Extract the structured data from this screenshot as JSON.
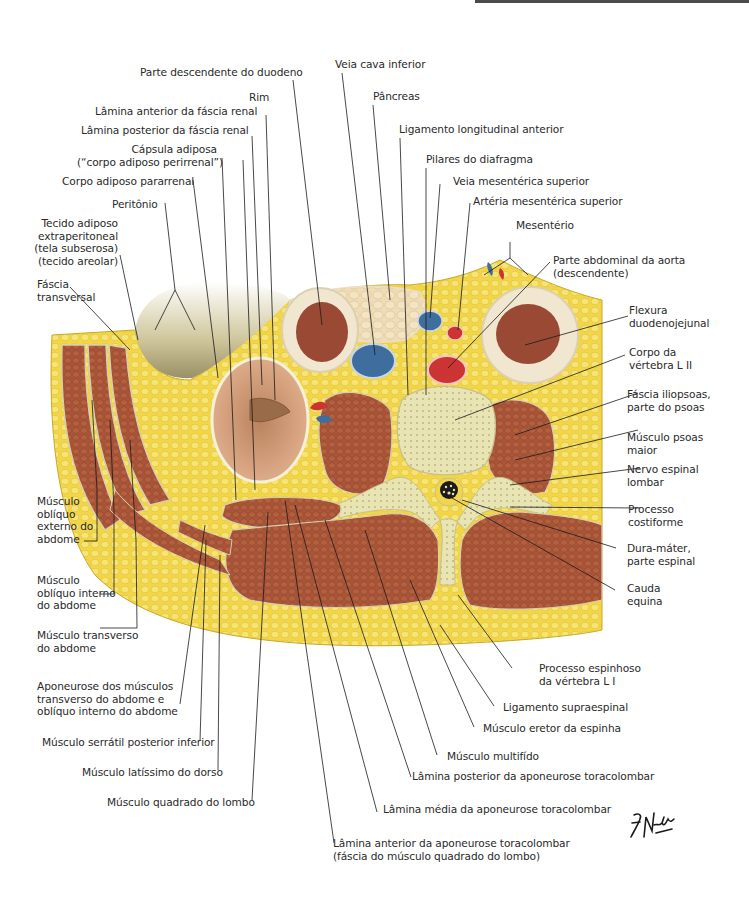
{
  "figure": {
    "signature": "F. Netter M.D.",
    "colors": {
      "fat": "#f2d64a",
      "fat_light": "#f8ea8c",
      "muscle": "#a9553a",
      "muscle_dark": "#8a3f28",
      "kidney": "#d9a27f",
      "bone": "#e8e4b4",
      "vein": "#3f6e9e",
      "artery": "#cc3433",
      "peritoneal_cavity": "#b9b083",
      "bowel": "#9a4a34",
      "pancreas": "#efdcb6",
      "leader": "#1a1a1a"
    }
  },
  "labels": {
    "veia_cava_inferior": "Veia cava inferior",
    "parte_descendente_duodeno": "Parte descendente do duodeno",
    "pancreas": "Pâncreas",
    "rim": "Rim",
    "lamina_anterior_fascia_renal": "Lâmina anterior da fáscia renal",
    "ligamento_longitudinal_anterior": "Ligamento longitudinal anterior",
    "lamina_posterior_fascia_renal": "Lâmina posterior da fáscia renal",
    "pilares_diafragma": "Pilares do diafragma",
    "capsula_adiposa_1": "Cápsula adiposa",
    "capsula_adiposa_2": "(“corpo adiposo perirrenal”)",
    "veia_mesenterica_superior": "Veia mesentérica superior",
    "corpo_adiposo_pararrenal": "Corpo adiposo pararrenal",
    "arteria_mesenterica_superior": "Artéria mesentérica superior",
    "peritonio": "Peritônio",
    "mesenterio": "Mesentério",
    "tecido_adiposo_1": "Tecido adiposo",
    "tecido_adiposo_2": "extraperitoneal",
    "tecido_adiposo_3": "(tela subserosa)",
    "tecido_adiposo_4": "(tecido areolar)",
    "parte_abdominal_aorta_1": "Parte abdominal da aorta",
    "parte_abdominal_aorta_2": "(descendente)",
    "fascia_transversal_1": "Fáscia",
    "fascia_transversal_2": "transversal",
    "flexura_1": "Flexura",
    "flexura_2": "duodenojejunal",
    "corpo_vertebra_1": "Corpo da",
    "corpo_vertebra_2": "vértebra L II",
    "fascia_iliopsoas_1": "Fáscia iliopsoas,",
    "fascia_iliopsoas_2": "parte do psoas",
    "psoas_1": "Músculo psoas",
    "psoas_2": "maior",
    "nervo_1": "Nervo espinal",
    "nervo_2": "lombar",
    "obliquo_externo_1": "Músculo",
    "obliquo_externo_2": "oblíquo",
    "obliquo_externo_3": "externo do",
    "obliquo_externo_4": "abdome",
    "processo_costiforme_1": "Processo",
    "processo_costiforme_2": "costiforme",
    "dura_1": "Dura-máter,",
    "dura_2": "parte espinal",
    "obliquo_interno_1": "Músculo",
    "obliquo_interno_2": "oblíquo interno",
    "obliquo_interno_3": "do abdome",
    "cauda_1": "Cauda",
    "cauda_2": "equina",
    "transverso_1": "Músculo transverso",
    "transverso_2": "do abdome",
    "aponeurose_1": "Aponeurose dos músculos",
    "aponeurose_2": "transverso do abdome e",
    "aponeurose_3": "oblíquo interno do abdome",
    "processo_espinhoso_1": "Processo espinhoso",
    "processo_espinhoso_2": "da vértebra L I",
    "ligamento_supraespinal": "Ligamento supraespinal",
    "serratil": "Músculo serrátil posterior inferior",
    "eretor": "Músculo eretor da espinha",
    "multifido": "Músculo multifído",
    "latissimo": "Músculo latíssimo do dorso",
    "lamina_posterior_aponeurose": "Lâmina posterior da aponeurose toracolombar",
    "quadrado": "Músculo quadrado do lombo",
    "lamina_media_aponeurose": "Lâmina média da aponeurose toracolombar",
    "lamina_anterior_aponeurose_1": "Lâmina anterior da aponeurose toracolombar",
    "lamina_anterior_aponeurose_2": "(fáscia do músculo quadrado do lombo)"
  }
}
